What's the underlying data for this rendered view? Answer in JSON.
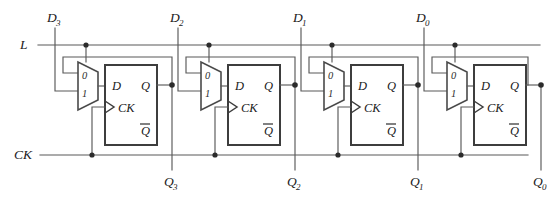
{
  "figure": {
    "background_color": "#ffffff",
    "wire_color": "#595959",
    "box_color": "#3d3d3d",
    "text_color": "#1a1a1a",
    "width": 552,
    "height": 201
  },
  "inputs": {
    "load": {
      "label": "L",
      "y": 45
    },
    "clock": {
      "label": "CK",
      "y": 155
    },
    "data": [
      {
        "label": "D",
        "sub": "3",
        "x": 55
      },
      {
        "label": "D",
        "sub": "2",
        "x": 178
      },
      {
        "label": "D",
        "sub": "1",
        "x": 301
      },
      {
        "label": "D",
        "sub": "0",
        "x": 424
      }
    ]
  },
  "outputs": [
    {
      "label": "Q",
      "sub": "3",
      "x": 172
    },
    {
      "label": "Q",
      "sub": "2",
      "x": 295
    },
    {
      "label": "Q",
      "sub": "1",
      "x": 418
    },
    {
      "label": "Q",
      "sub": "0",
      "x": 541
    }
  ],
  "stages": [
    {
      "name": "stage-3",
      "mux": {
        "label_0": "0",
        "label_1": "1",
        "x": 78
      },
      "flipflop": {
        "d_label": "D",
        "q_label": "Q",
        "ck_label": "CK",
        "qbar_label": "Q",
        "x": 105
      }
    },
    {
      "name": "stage-2",
      "mux": {
        "label_0": "0",
        "label_1": "1",
        "x": 201
      },
      "flipflop": {
        "d_label": "D",
        "q_label": "Q",
        "ck_label": "CK",
        "qbar_label": "Q",
        "x": 228
      }
    },
    {
      "name": "stage-1",
      "mux": {
        "label_0": "0",
        "label_1": "1",
        "x": 324
      },
      "flipflop": {
        "d_label": "D",
        "q_label": "Q",
        "ck_label": "CK",
        "qbar_label": "Q",
        "x": 351
      }
    },
    {
      "name": "stage-0",
      "mux": {
        "label_0": "0",
        "label_1": "1",
        "x": 447
      },
      "flipflop": {
        "d_label": "D",
        "q_label": "Q",
        "ck_label": "CK",
        "qbar_label": "Q",
        "x": 474
      }
    }
  ]
}
